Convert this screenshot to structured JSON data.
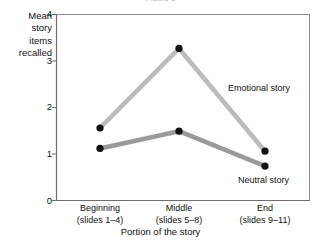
{
  "figure": {
    "clipped_title": "Figure 1",
    "background": "#ffffff"
  },
  "axes": {
    "y_label_lines": [
      "Mean",
      "story",
      "items",
      "recalled"
    ],
    "y_ticks": [
      "0",
      "1",
      "2",
      "3",
      "4"
    ],
    "x_title": "Portion of the story",
    "x_categories": [
      {
        "name": "Beginning",
        "sub": "(slides 1–4)"
      },
      {
        "name": "Middle",
        "sub": "(slides 5–8)"
      },
      {
        "name": "End",
        "sub": "(slides 9–11)"
      }
    ]
  },
  "annotations": {
    "emotional": "Emotional story",
    "neutral": "Neutral story"
  },
  "colors": {
    "emotional_line": "#bcbcbc",
    "neutral_line": "#9a9a9a",
    "marker": "#111111",
    "frame": "#8d8d8d",
    "text": "#111111"
  },
  "chart_data": {
    "type": "line",
    "title": "",
    "xlabel": "Portion of the story",
    "ylabel": "Mean story items recalled",
    "categories": [
      "Beginning (slides 1–4)",
      "Middle (slides 5–8)",
      "End (slides 9–11)"
    ],
    "ylim": [
      0,
      4
    ],
    "yticks": [
      0,
      1,
      2,
      3,
      4
    ],
    "grid": false,
    "legend": "inline-annotations",
    "series": [
      {
        "name": "Emotional story",
        "color": "#bcbcbc",
        "values": [
          1.56,
          3.27,
          1.06
        ]
      },
      {
        "name": "Neutral story",
        "color": "#9a9a9a",
        "values": [
          1.12,
          1.49,
          0.74
        ]
      }
    ]
  }
}
